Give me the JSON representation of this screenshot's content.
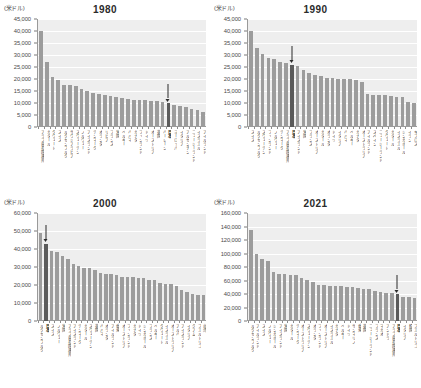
{
  "figure": {
    "unit_label": "(米ドル)",
    "caption": "",
    "bar_color": "#9c9c9c",
    "highlight_color": "#5b5b5b",
    "plot_background": "#eeeeee"
  },
  "chart_data": [
    {
      "type": "bar",
      "title": "1980",
      "xlabel": "",
      "ylabel": "(米ドル)",
      "ylim": [
        0,
        45000
      ],
      "yticks": [
        0,
        5000,
        10000,
        15000,
        20000,
        25000,
        30000,
        35000,
        40000,
        45000
      ],
      "ytick_labels": [
        "0",
        "5,000",
        "10,000",
        "15,000",
        "20,000",
        "25,000",
        "30,000",
        "35,000",
        "40,000",
        "45,000"
      ],
      "grid": true,
      "highlight_category": "日本",
      "annotation": "arrow points to 日本",
      "categories": [
        "アラブ首長国連邦",
        "カタール",
        "クウェート",
        "スイス",
        "ルクセンブルク",
        "サウジアラビア",
        "スウェーデン",
        "ノルウェー",
        "アイスランド",
        "デンマーク",
        "オランダ",
        "リビア",
        "フランス",
        "米国",
        "ベルギー",
        "バハマ",
        "カナダ",
        "フィンランド",
        "ドイツ",
        "オーストリア",
        "英国",
        "バーレーン",
        "日本",
        "ヨーロッパ",
        "イタリア",
        "アルゼンチン",
        "ニュージーランド",
        "イスラエル",
        "アイルランド"
      ],
      "values": [
        40200,
        27200,
        20900,
        19500,
        17700,
        17500,
        17200,
        16000,
        15000,
        14100,
        13900,
        13500,
        12800,
        12600,
        12200,
        11500,
        11300,
        11200,
        11100,
        11000,
        10800,
        10500,
        10000,
        9300,
        8900,
        8300,
        7700,
        6900,
        6400
      ]
    },
    {
      "type": "bar",
      "title": "1990",
      "xlabel": "",
      "ylabel": "(米ドル)",
      "ylim": [
        0,
        45000
      ],
      "yticks": [
        0,
        5000,
        10000,
        15000,
        20000,
        25000,
        30000,
        35000,
        40000,
        45000
      ],
      "ytick_labels": [
        "0",
        "5,000",
        "10,000",
        "15,000",
        "20,000",
        "25,000",
        "30,000",
        "35,000",
        "40,000",
        "45,000"
      ],
      "grid": true,
      "highlight_category": "日本",
      "annotation": "arrow points to 日本",
      "categories": [
        "スイス",
        "ルクセンブルク",
        "スウェーデン",
        "フィンランド",
        "ノルウェー",
        "デンマーク",
        "アラブ首長国連邦",
        "日本",
        "アイスランド",
        "米国",
        "フランス",
        "オーストリア",
        "カタール",
        "オランダ",
        "ドイツ",
        "イタリア",
        "バハマ",
        "ベルギー",
        "カナダ",
        "オーストラリア",
        "アイルランド",
        "スペイン",
        "ニュージーランド",
        "クウェート",
        "カタール",
        "イスラエル",
        "シンガポール",
        "イラン",
        "キプロス"
      ],
      "values": [
        40100,
        33100,
        30300,
        28900,
        28200,
        27000,
        26800,
        26000,
        25600,
        23900,
        22600,
        21500,
        21100,
        20600,
        20300,
        20200,
        20100,
        20000,
        19700,
        18800,
        13600,
        13500,
        13400,
        13200,
        12900,
        12700,
        12300,
        10600,
        9900
      ]
    },
    {
      "type": "bar",
      "title": "2000",
      "xlabel": "",
      "ylabel": "(米ドル)",
      "ylim": [
        0,
        60000
      ],
      "yticks": [
        0,
        10000,
        20000,
        30000,
        40000,
        50000,
        60000
      ],
      "ytick_labels": [
        "0",
        "10,000",
        "20,000",
        "30,000",
        "40,000",
        "50,000",
        "60,000"
      ],
      "grid": true,
      "highlight_category": "日本",
      "annotation": "arrow points to 日本",
      "categories": [
        "ルクセンブルク",
        "日本",
        "スイス",
        "ノルウェー",
        "米国",
        "アラブ首長国連邦",
        "アイスランド",
        "デンマーク",
        "カタール",
        "スウェーデン",
        "英国",
        "バハマ",
        "オランダ",
        "アイルランド",
        "香港",
        "オーストリア",
        "フィンランド",
        "カナダ",
        "ドイツ",
        "シンガポール",
        "フランス",
        "ベルギー",
        "クウェート",
        "イスラエル",
        "オーストラリア",
        "アルバ",
        "アイスランド",
        "イタリア",
        "グアム",
        "プエルトリコ",
        "台湾"
      ],
      "values": [
        48900,
        43000,
        39000,
        38100,
        36300,
        34700,
        31400,
        30700,
        29500,
        29400,
        28100,
        26800,
        26200,
        26000,
        25700,
        24600,
        24400,
        24300,
        24100,
        23900,
        22800,
        22700,
        21000,
        20700,
        20400,
        19600,
        17400,
        16100,
        15000,
        14400,
        14200
      ]
    },
    {
      "type": "bar",
      "title": "2021",
      "xlabel": "",
      "ylabel": "(米ドル)",
      "ylim": [
        0,
        160000
      ],
      "yticks": [
        0,
        20000,
        40000,
        60000,
        80000,
        100000,
        120000,
        140000,
        160000
      ],
      "ytick_labels": [
        "0",
        "20,000",
        "40,000",
        "60,000",
        "80,000",
        "100,000",
        "120,000",
        "140,000",
        "160,000"
      ],
      "grid": true,
      "highlight_category": "日本",
      "annotation": "arrow points to 日本",
      "categories": [
        "ルクセンブルク",
        "アイルランド",
        "スイス",
        "ノルウェー",
        "シンガポール",
        "アイスランド",
        "米国",
        "カタール",
        "デンマーク",
        "オーストラリア",
        "スウェーデン",
        "オランダ",
        "フィンランド",
        "オーストリア",
        "イスラエル",
        "カナダ",
        "ベルギー",
        "ドイツ",
        "サンマリノ",
        "香港",
        "英国",
        "ニュージーランド",
        "フランス",
        "マカオ",
        "アンドラ",
        "アラブ首長国連邦",
        "日本",
        "イタリア",
        "韓国",
        "プエルトリコ"
      ],
      "values": [
        135000,
        100000,
        92500,
        89000,
        72000,
        69000,
        69000,
        68000,
        68000,
        63000,
        61000,
        58000,
        54000,
        53500,
        52000,
        52000,
        51500,
        51000,
        50000,
        49500,
        47500,
        48000,
        44000,
        42500,
        42000,
        41500,
        39500,
        35500,
        35000,
        34500
      ]
    }
  ]
}
